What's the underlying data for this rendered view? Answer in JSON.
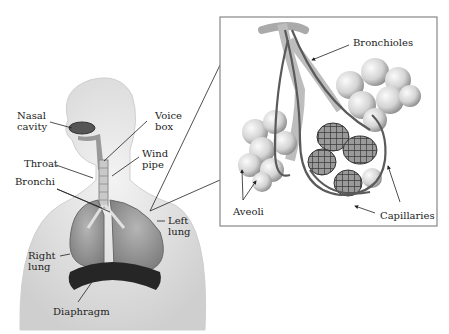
{
  "diagram": {
    "body_labels": [
      {
        "id": "nasal-cavity",
        "text": "Nasal\ncavity",
        "x": 17,
        "y": 110
      },
      {
        "id": "voice-box",
        "text": "Voice\nbox",
        "x": 155,
        "y": 110
      },
      {
        "id": "throat",
        "text": "Throat",
        "x": 24,
        "y": 156
      },
      {
        "id": "wind-pipe",
        "text": "Wind\npipe",
        "x": 143,
        "y": 149
      },
      {
        "id": "bronchi",
        "text": "Bronchi",
        "x": 17,
        "y": 176
      },
      {
        "id": "left-lung",
        "text": "Left\nlung",
        "x": 168,
        "y": 216
      },
      {
        "id": "right-lung",
        "text": "Right\nlung",
        "x": 28,
        "y": 250
      },
      {
        "id": "diaphragm",
        "text": "Diaphragm",
        "x": 53,
        "y": 305
      }
    ],
    "inset_labels": [
      {
        "id": "bronchioles",
        "text": "Bronchioles",
        "x": 353,
        "y": 37
      },
      {
        "id": "aveoli",
        "text": "Aveoli",
        "x": 233,
        "y": 206
      },
      {
        "id": "capillaries",
        "text": "Capillaries",
        "x": 379,
        "y": 210
      }
    ],
    "inset_box": {
      "x": 220,
      "y": 17,
      "width": 217,
      "height": 209
    },
    "colors": {
      "line": "#333333",
      "skin": "#e6e6e6",
      "lung": "#9a9a9a",
      "diaphragm": "#2a2a2a",
      "alveoli": "#d8d8d8",
      "capillary": "#5a5a5a"
    }
  }
}
